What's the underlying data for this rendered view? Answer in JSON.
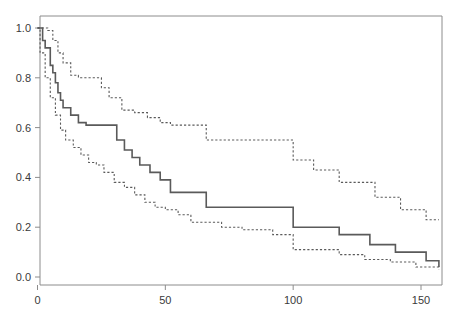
{
  "chart_data": {
    "type": "line",
    "title": "",
    "subtitle": "",
    "xlabel": "",
    "ylabel": "",
    "xlim": [
      0,
      157
    ],
    "ylim": [
      0.0,
      1.02
    ],
    "grid": false,
    "legend": false,
    "legend_position": "none",
    "style": "kaplan-meier step function with 95% confidence bands",
    "xticks": [
      0,
      50,
      100,
      150
    ],
    "xtick_labels": [
      "0",
      "50",
      "100",
      "150"
    ],
    "yticks": [
      0.0,
      0.2,
      0.4,
      0.6,
      0.8,
      1.0
    ],
    "ytick_labels": [
      "0.0",
      "0.2",
      "0.4",
      "0.6",
      "0.8",
      "1.0"
    ],
    "colors": {
      "estimate": "#5a5a5a",
      "confidence_band": "#5a5a5a",
      "axis": "#8c8c8c",
      "text": "#3a3a3a",
      "background": "#ffffff"
    },
    "series": [
      {
        "name": "survival-estimate",
        "style": "solid",
        "x": [
          0,
          1,
          2,
          3,
          4,
          5,
          6,
          7,
          8,
          9,
          10,
          13,
          16,
          19,
          22,
          25,
          28,
          31,
          34,
          37,
          40,
          44,
          48,
          52,
          58,
          63,
          66,
          100,
          108,
          118,
          130,
          140,
          152,
          157
        ],
        "values": [
          1.0,
          1.0,
          0.95,
          0.92,
          0.92,
          0.85,
          0.82,
          0.78,
          0.74,
          0.71,
          0.68,
          0.65,
          0.62,
          0.61,
          0.61,
          0.61,
          0.61,
          0.55,
          0.51,
          0.48,
          0.45,
          0.42,
          0.39,
          0.34,
          0.34,
          0.34,
          0.28,
          0.2,
          0.2,
          0.17,
          0.13,
          0.1,
          0.065,
          0.04
        ]
      },
      {
        "name": "upper-confidence-limit",
        "style": "dashed",
        "x": [
          0,
          2,
          4,
          6,
          8,
          10,
          13,
          16,
          20,
          25,
          28,
          33,
          38,
          43,
          48,
          52,
          58,
          63,
          66,
          76,
          86,
          100,
          108,
          118,
          125,
          132,
          142,
          152,
          157
        ],
        "values": [
          1.0,
          1.0,
          0.99,
          0.95,
          0.9,
          0.86,
          0.81,
          0.8,
          0.8,
          0.76,
          0.72,
          0.67,
          0.66,
          0.64,
          0.62,
          0.61,
          0.61,
          0.61,
          0.55,
          0.55,
          0.55,
          0.47,
          0.43,
          0.38,
          0.38,
          0.32,
          0.27,
          0.23,
          0.23
        ]
      },
      {
        "name": "lower-confidence-limit",
        "style": "dashed",
        "x": [
          0,
          1,
          3,
          5,
          7,
          9,
          11,
          14,
          17,
          20,
          23,
          26,
          30,
          34,
          38,
          42,
          46,
          50,
          55,
          60,
          66,
          72,
          80,
          92,
          100,
          110,
          118,
          128,
          138,
          148,
          157
        ],
        "values": [
          1.0,
          0.9,
          0.8,
          0.72,
          0.65,
          0.59,
          0.55,
          0.52,
          0.49,
          0.46,
          0.45,
          0.42,
          0.38,
          0.36,
          0.33,
          0.3,
          0.28,
          0.27,
          0.25,
          0.22,
          0.22,
          0.2,
          0.19,
          0.17,
          0.11,
          0.11,
          0.09,
          0.07,
          0.06,
          0.04,
          0.03
        ]
      }
    ]
  },
  "axes": {
    "x_tick_labels": [
      "0",
      "50",
      "100",
      "150"
    ],
    "y_tick_labels": [
      "0.0",
      "0.2",
      "0.4",
      "0.6",
      "0.8",
      "1.0"
    ]
  }
}
